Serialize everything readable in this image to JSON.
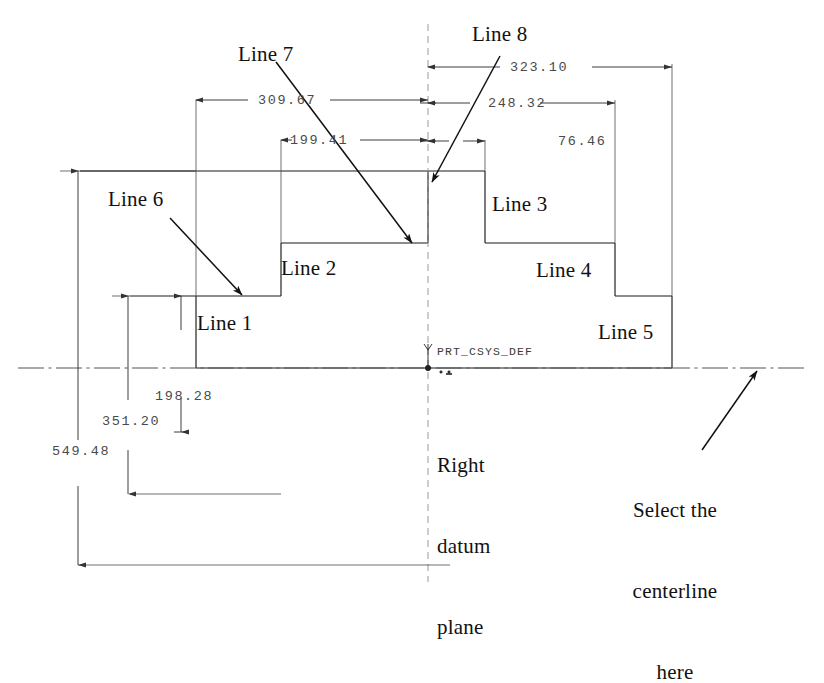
{
  "drawing": {
    "title": "Pro/ENGINEER sketch with linear dimensions",
    "units_note": "",
    "stroke_color": "#1a1a1a",
    "dim_color": "#4a4a4a",
    "centerline_color": "#8a8a8a"
  },
  "coord_system": {
    "label": "PRT_CSYS_DEF",
    "axis_y_glyph": "Y"
  },
  "dimensions": [
    {
      "id": "dim-309-67",
      "value": "309.67"
    },
    {
      "id": "dim-199-41",
      "value": "199.41"
    },
    {
      "id": "dim-323-10",
      "value": "323.10"
    },
    {
      "id": "dim-248-32",
      "value": "248.32"
    },
    {
      "id": "dim-76-46",
      "value": "76.46"
    },
    {
      "id": "dim-198-28",
      "value": "198.28"
    },
    {
      "id": "dim-351-20",
      "value": "351.20"
    },
    {
      "id": "dim-549-48",
      "value": "549.48"
    }
  ],
  "line_labels": [
    {
      "id": "line-1",
      "text": "Line 1"
    },
    {
      "id": "line-2",
      "text": "Line 2"
    },
    {
      "id": "line-3",
      "text": "Line 3"
    },
    {
      "id": "line-4",
      "text": "Line 4"
    },
    {
      "id": "line-5",
      "text": "Line 5"
    },
    {
      "id": "line-6",
      "text": "Line 6"
    },
    {
      "id": "line-7",
      "text": "Line 7"
    },
    {
      "id": "line-8",
      "text": "Line 8"
    }
  ],
  "annotations": {
    "right_datum_plane": "Right\ndatum\nplane",
    "right_datum_plane_l1": "Right",
    "right_datum_plane_l2": "datum",
    "right_datum_plane_l3": "plane",
    "select_centerline": "Select the\ncenterline\nhere",
    "select_centerline_l1": "Select the",
    "select_centerline_l2": "centerline",
    "select_centerline_l3": "here"
  }
}
